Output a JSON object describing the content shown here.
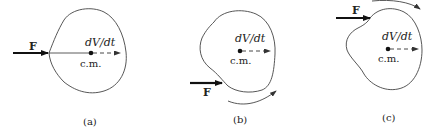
{
  "panels": [
    {
      "caption": "(a)",
      "force_label": "F",
      "accel_label": "dV/dt",
      "cm_label": "c.m.",
      "force_position": "through center of mass",
      "rotation": "none"
    },
    {
      "caption": "(b)",
      "force_label": "F",
      "accel_label": "dV/dt",
      "cm_label": "c.m.",
      "force_position": "below center of mass",
      "rotation": "counterclockwise"
    },
    {
      "caption": "(c)",
      "force_label": "F",
      "accel_label": "dV/dt",
      "cm_label": "c.m.",
      "force_position": "above center of mass",
      "rotation": "clockwise"
    }
  ],
  "colors": {
    "stroke": "#444444",
    "force": "#111111",
    "background": "#ffffff"
  }
}
